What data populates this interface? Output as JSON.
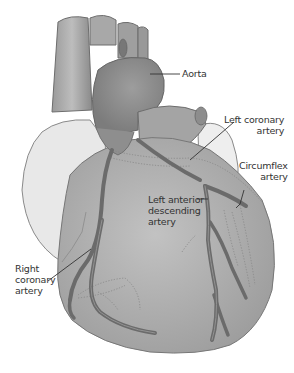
{
  "figure": {
    "labels": {
      "aorta": "Aorta",
      "left_coronary_artery": "Left coronary\nartery",
      "circumflex_artery": "Circumflex\nartery",
      "left_anterior_descending_artery": "Left anterior\ndescending\nartery",
      "right_coronary_artery": "Right\ncoronary\nartery"
    },
    "colors": {
      "background": "#ffffff",
      "heart_body": "#a9a9a9",
      "vessels": "#8c8c8c",
      "atrium_light": "#e6e6e6",
      "artery": "#6e6e6e",
      "leader_line": "#333333",
      "text": "#333333"
    }
  }
}
